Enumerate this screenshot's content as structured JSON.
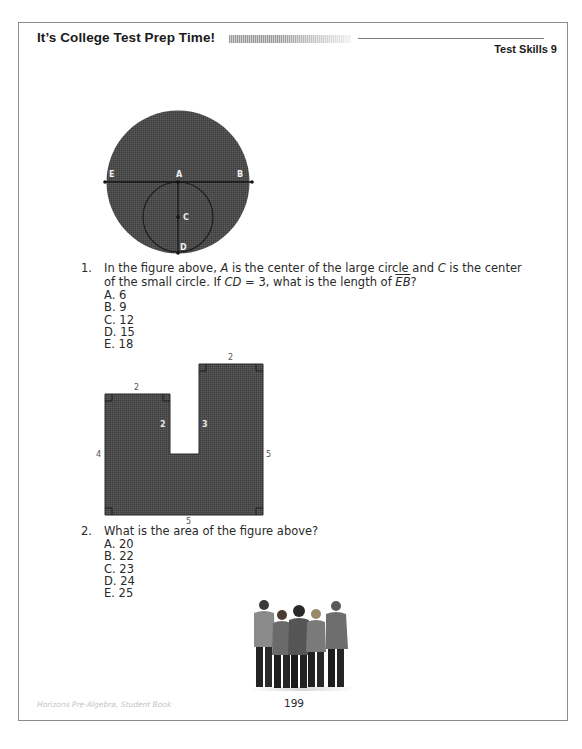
{
  "header": {
    "title": "It’s College Test Prep Time!",
    "section": "Test Skills 9"
  },
  "questions": [
    {
      "number": "1.",
      "figure": {
        "type": "circles",
        "labels": {
          "E": "E",
          "A": "A",
          "B": "B",
          "C": "C",
          "D": "D"
        }
      },
      "text_parts": {
        "p1": "In the figure above, ",
        "A": "A",
        "p2": " is the center of the large circle and ",
        "C": "C",
        "p3": " is the center of the small circle. If ",
        "CD": "CD",
        "p4": " = 3, what is the length of ",
        "EB": "EB",
        "p5": "?"
      },
      "choices": [
        "A. 6",
        "B. 9",
        "C. 12",
        "D. 15",
        "E. 18"
      ]
    },
    {
      "number": "2.",
      "figure": {
        "type": "u-shape",
        "dimensions": {
          "left_top": "2",
          "right_top": "2",
          "left_inner": "2",
          "right_inner": "3",
          "left_side": "4",
          "right_side": "5",
          "bottom": "5"
        }
      },
      "text": "What is the area of the figure above?",
      "choices": [
        "A. 20",
        "B. 22",
        "C. 23",
        "D. 24",
        "E. 25"
      ]
    }
  ],
  "image": {
    "description": "group of five students standing together"
  },
  "footer": {
    "book": "Horizons Pre-Algebra, Student Book",
    "page_number": "199"
  },
  "colors": {
    "figure_fill": "#4a4a4a",
    "border": "#8c8c8c",
    "text": "#2a2a2a"
  }
}
